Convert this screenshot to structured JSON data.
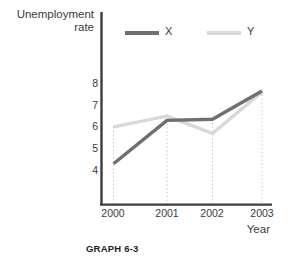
{
  "chart_data": {
    "type": "line",
    "title": "",
    "caption": "GRAPH 6-3",
    "xlabel": "Year",
    "ylabel": "Unemployment rate",
    "ylabel_line1": "Unemployment",
    "ylabel_line2": "rate",
    "categories": [
      "2000",
      "2001",
      "2002",
      "2003"
    ],
    "x": [
      2000,
      2001,
      2002,
      2003
    ],
    "yticks": [
      4,
      5,
      6,
      7,
      8
    ],
    "ylim": [
      3.2,
      8.6
    ],
    "grid": "vertical-dotted-at-categories",
    "legend_position": "top-inside",
    "series": [
      {
        "name": "X",
        "color": "#6f6f6f",
        "values": [
          4.3,
          6.3,
          6.35,
          7.65
        ]
      },
      {
        "name": "Y",
        "color": "#d9d9d9",
        "values": [
          6.0,
          6.5,
          5.7,
          7.6
        ]
      }
    ],
    "axis_color": "#3c3c3c",
    "gridline_color": "#bdbdbd"
  },
  "legend": {
    "items": [
      {
        "label": "X"
      },
      {
        "label": "Y"
      }
    ]
  },
  "axes": {
    "y_tick_labels": [
      "8",
      "7",
      "6",
      "5",
      "4"
    ],
    "x_tick_labels": [
      "2000",
      "2001",
      "2002",
      "2003"
    ]
  }
}
